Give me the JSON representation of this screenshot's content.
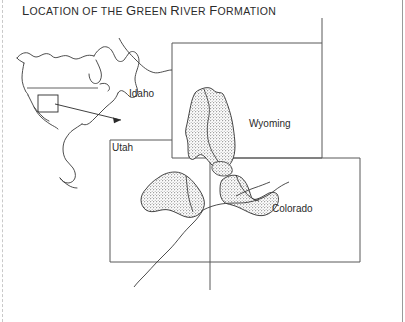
{
  "figure": {
    "title": "Location of the Green River Formation",
    "title_parts": [
      {
        "text": "L",
        "style": "cap"
      },
      {
        "text": "OCATION OF THE ",
        "style": "sc"
      },
      {
        "text": "G",
        "style": "cap"
      },
      {
        "text": "REEN ",
        "style": "sc"
      },
      {
        "text": "R",
        "style": "cap"
      },
      {
        "text": "IVER ",
        "style": "sc"
      },
      {
        "text": "F",
        "style": "cap"
      },
      {
        "text": "ORMATION",
        "style": "sc"
      }
    ]
  },
  "map": {
    "state_labels": [
      {
        "id": "idaho",
        "label": "Idaho"
      },
      {
        "id": "utah",
        "label": "Utah"
      },
      {
        "id": "wyoming",
        "label": "Wyoming"
      },
      {
        "id": "colorado",
        "label": "Colorado"
      }
    ],
    "formation_name": "Green River Formation",
    "basins": [
      {
        "name": "Green River Basin",
        "state": "Wyoming"
      },
      {
        "name": "Uinta Basin",
        "state": "Utah"
      },
      {
        "name": "Piceance Basin",
        "state": "Colorado"
      }
    ],
    "river_name": "Colorado River",
    "inset": {
      "region": "North America",
      "highlight_box": "study area",
      "pointer": "arrow"
    },
    "colors": {
      "ink": "#2a2a2a",
      "border": "#555555",
      "stipple": "#8a8a8a",
      "background": "#ffffff",
      "page_edge": "#9a9a9a"
    }
  }
}
